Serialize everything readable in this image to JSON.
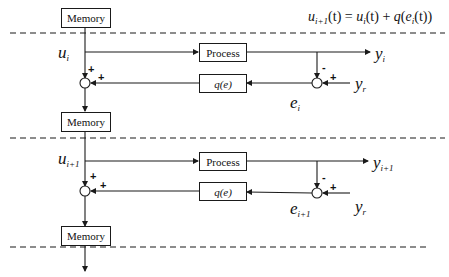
{
  "equation": {
    "lhs_var": "u",
    "lhs_sub": "i+1",
    "text_mid": "(t) = ",
    "rhs_u": "u",
    "rhs_u_sub": "i",
    "rhs_rest_1": "(t) + ",
    "rhs_q": "q",
    "rhs_rest_2": "(",
    "rhs_e": "e",
    "rhs_e_sub": "i",
    "rhs_rest_3": "(t))"
  },
  "blocks": {
    "memory_1": "Memory",
    "memory_2": "Memory",
    "memory_3": "Memory",
    "process_1": "Process",
    "process_2": "Process",
    "learning_1": "q(e)",
    "learning_2": "q(e)"
  },
  "iteration_i": {
    "input": {
      "var": "u",
      "sub": "i"
    },
    "output": {
      "var": "y",
      "sub": "i"
    },
    "reference": {
      "var": "y",
      "sub": "r"
    },
    "error": {
      "var": "e",
      "sub": "i"
    },
    "left_signs": [
      "+",
      "+"
    ],
    "right_signs": [
      "-",
      "+"
    ]
  },
  "iteration_i1": {
    "input": {
      "var": "u",
      "sub": "i+1"
    },
    "output": {
      "var": "y",
      "sub": "i+1"
    },
    "reference": {
      "var": "y",
      "sub": "r"
    },
    "error": {
      "var": "e",
      "sub": "i+1"
    },
    "left_signs": [
      "+",
      "+"
    ],
    "right_signs": [
      "-",
      "+"
    ]
  },
  "colors": {
    "line": "#1a1a1a",
    "background": "#ffffff"
  }
}
